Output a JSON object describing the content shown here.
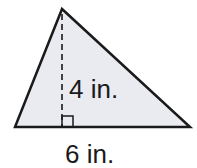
{
  "figure": {
    "shape": "triangle",
    "height_label": "4 in.",
    "base_label": "6 in.",
    "fill_color": "#e9ebf1",
    "stroke_color": "#1a1a1a",
    "right_angle_marker": true,
    "height_line_style": "dashed"
  }
}
